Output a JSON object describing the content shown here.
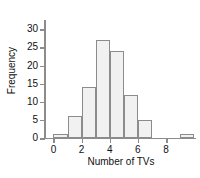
{
  "chart_data": {
    "type": "bar",
    "title": "",
    "subtitle": "",
    "xlabel": "Number of TVs",
    "ylabel": "Frequency",
    "xlim": [
      -0.6,
      10.2
    ],
    "ylim": [
      0,
      32
    ],
    "grid": false,
    "legend": null,
    "bin_width": 1,
    "bin_starts": [
      0,
      1,
      2,
      3,
      4,
      5,
      6,
      9
    ],
    "categories": [
      "0",
      "1",
      "2",
      "3",
      "4",
      "5",
      "6",
      "9"
    ],
    "values": [
      1,
      6,
      14,
      27,
      24,
      12,
      5,
      1
    ],
    "bars": [
      {
        "bin_start": 0,
        "bin_end": 1,
        "value": 1
      },
      {
        "bin_start": 1,
        "bin_end": 2,
        "value": 6
      },
      {
        "bin_start": 2,
        "bin_end": 3,
        "value": 14
      },
      {
        "bin_start": 3,
        "bin_end": 4,
        "value": 27
      },
      {
        "bin_start": 4,
        "bin_end": 5,
        "value": 24
      },
      {
        "bin_start": 5,
        "bin_end": 6,
        "value": 12
      },
      {
        "bin_start": 6,
        "bin_end": 7,
        "value": 5
      },
      {
        "bin_start": 9,
        "bin_end": 10,
        "value": 1
      }
    ],
    "yticks": [
      0,
      5,
      10,
      15,
      20,
      25,
      30
    ],
    "ytick_labels": [
      "0",
      "5",
      "10",
      "15",
      "20",
      "25",
      "30"
    ],
    "xticks": [
      0,
      2,
      4,
      6,
      8
    ],
    "xtick_labels": [
      "0",
      "2",
      "4",
      "6",
      "8"
    ],
    "colors": {
      "bar_fill": "#f1f1f1",
      "bar_edge": "#8c8c8c",
      "axis": "#8c8c8c",
      "text": "#111111",
      "background": "#ffffff"
    }
  }
}
